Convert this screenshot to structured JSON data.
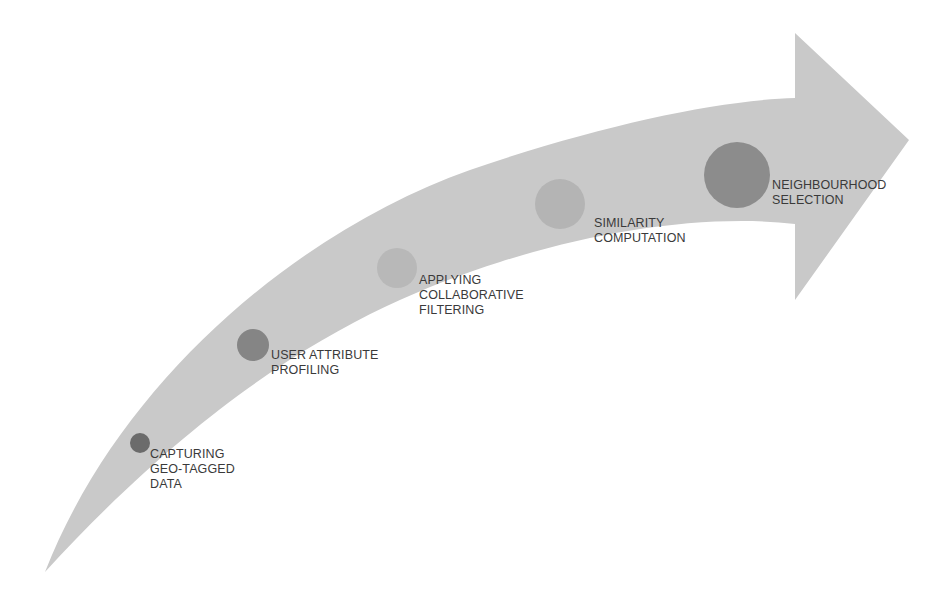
{
  "diagram": {
    "type": "process-flow-arrow",
    "arrow_color": "#c9c9c9",
    "steps": [
      {
        "order": 1,
        "lines": [
          "CAPTURING",
          "GEO-TAGGED",
          "DATA"
        ],
        "circle": {
          "cx": 140,
          "cy": 443,
          "r": 10,
          "color": "#6b6b6b"
        },
        "label_pos": {
          "left": 150,
          "top": 447
        }
      },
      {
        "order": 2,
        "lines": [
          "USER ATTRIBUTE",
          "PROFILING"
        ],
        "circle": {
          "cx": 253,
          "cy": 345,
          "r": 16,
          "color": "#858585"
        },
        "label_pos": {
          "left": 271,
          "top": 348
        }
      },
      {
        "order": 3,
        "lines": [
          "APPLYING",
          "COLLABORATIVE",
          "FILTERING"
        ],
        "circle": {
          "cx": 397,
          "cy": 268,
          "r": 20,
          "color": "#b8b8b8"
        },
        "label_pos": {
          "left": 419,
          "top": 273
        }
      },
      {
        "order": 4,
        "lines": [
          "SIMILARITY",
          "COMPUTATION"
        ],
        "circle": {
          "cx": 560,
          "cy": 204,
          "r": 25,
          "color": "#b4b4b4"
        },
        "label_pos": {
          "left": 594,
          "top": 216
        }
      },
      {
        "order": 5,
        "lines": [
          "NEIGHBOURHOOD",
          "SELECTION"
        ],
        "circle": {
          "cx": 737,
          "cy": 175,
          "r": 33,
          "color": "#8c8c8c"
        },
        "label_pos": {
          "left": 772,
          "top": 178
        }
      }
    ]
  }
}
